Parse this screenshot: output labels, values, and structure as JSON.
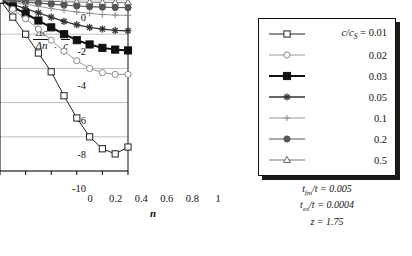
{
  "chart_data": {
    "type": "line",
    "title": "",
    "xlabel": "n",
    "ylabel": "(Δc/Δn)·(n/c)",
    "xlim": [
      0,
      1
    ],
    "ylim": [
      -10,
      0
    ],
    "xticks": [
      "0",
      "0.2",
      "0.4",
      "0.6",
      "0.8",
      "1"
    ],
    "xtick_values": [
      0,
      0.2,
      0.4,
      0.6,
      0.8,
      1
    ],
    "yticks": [
      "0",
      "-2",
      "-4",
      "-6",
      "-8",
      "-10"
    ],
    "ytick_values": [
      0,
      -2,
      -4,
      -6,
      -8,
      -10
    ],
    "grid": true,
    "legend_position": "right-outside",
    "x": [
      0,
      0.1,
      0.2,
      0.3,
      0.4,
      0.5,
      0.6,
      0.7,
      0.8,
      0.9,
      1.0
    ],
    "series": [
      {
        "name": "0.01",
        "marker": "open-square",
        "color": "#222222",
        "values": [
          0,
          -1.0,
          -2.0,
          -3.1,
          -4.2,
          -5.6,
          -6.9,
          -8.0,
          -8.7,
          -9.0,
          -8.6
        ]
      },
      {
        "name": "0.02",
        "marker": "open-circle",
        "color": "#8a8a8a",
        "values": [
          0,
          -0.55,
          -1.1,
          -1.7,
          -2.35,
          -3.0,
          -3.55,
          -4.0,
          -4.25,
          -4.35,
          -4.35
        ]
      },
      {
        "name": "0.03",
        "marker": "filled-square",
        "color": "#111111",
        "values": [
          0,
          -0.4,
          -0.8,
          -1.2,
          -1.6,
          -2.0,
          -2.35,
          -2.6,
          -2.8,
          -2.9,
          -2.95
        ]
      },
      {
        "name": "0.05",
        "marker": "star",
        "color": "#333333",
        "values": [
          0,
          -0.25,
          -0.5,
          -0.75,
          -1.0,
          -1.25,
          -1.45,
          -1.6,
          -1.7,
          -1.78,
          -1.8
        ]
      },
      {
        "name": "0.1",
        "marker": "plus",
        "color": "#8a8a8a",
        "values": [
          0,
          -0.12,
          -0.25,
          -0.37,
          -0.5,
          -0.6,
          -0.7,
          -0.78,
          -0.85,
          -0.88,
          -0.9
        ]
      },
      {
        "name": "0.2",
        "marker": "filled-circle",
        "color": "#555555",
        "values": [
          0,
          -0.06,
          -0.12,
          -0.18,
          -0.24,
          -0.3,
          -0.35,
          -0.39,
          -0.42,
          -0.44,
          -0.45
        ]
      },
      {
        "name": "0.5",
        "marker": "open-triangle",
        "color": "#666666",
        "values": [
          0,
          -0.02,
          -0.04,
          -0.06,
          -0.08,
          -0.1,
          -0.12,
          -0.13,
          -0.14,
          -0.15,
          -0.15
        ]
      }
    ]
  },
  "ylabel_parts": {
    "frac1_num": "Δc",
    "frac1_den": "Δn",
    "separator": "·",
    "frac2_num": "n",
    "frac2_den": "c"
  },
  "xaxis": {
    "label": "n",
    "ticks": [
      "0",
      "0.2",
      "0.4",
      "0.6",
      "0.8",
      "1"
    ]
  },
  "yaxis": {
    "ticks": [
      "0",
      "-2",
      "-4",
      "-6",
      "-8",
      "-10"
    ]
  },
  "legend": {
    "header_symbol": "c/c",
    "header_subscript": "S",
    "header_equals": " = ",
    "rows": [
      {
        "label": "0.01",
        "marker": "open-square",
        "show_header": true
      },
      {
        "label": "0.02",
        "marker": "open-circle",
        "show_header": false
      },
      {
        "label": "0.03",
        "marker": "filled-square",
        "show_header": false
      },
      {
        "label": "0.05",
        "marker": "star",
        "show_header": false
      },
      {
        "label": "0.1",
        "marker": "plus",
        "show_header": false
      },
      {
        "label": "0.2",
        "marker": "filled-circle",
        "show_header": false
      },
      {
        "label": "0.5",
        "marker": "open-triangle",
        "show_header": false
      }
    ]
  },
  "notes": {
    "line1_sym": "t",
    "line1_sub": "fm",
    "line1_rest": "/t = 0.005",
    "line2_sym": "t",
    "line2_sub": "ex",
    "line2_rest": "/t = 0.0004",
    "line3_sym": "z",
    "line3_rest": " = 1.75"
  },
  "colors": {
    "axis": "#111111",
    "grid": "#b8b8b8",
    "background": "#ffffff"
  }
}
